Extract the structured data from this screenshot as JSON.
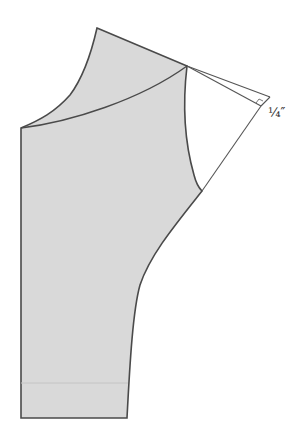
{
  "diagram": {
    "type": "sewing-pattern",
    "annotation_label": "¼″",
    "colors": {
      "fill": "#d9d9d9",
      "stroke": "#4a4a4a",
      "guide_stroke": "#555555",
      "background": "#ffffff"
    }
  }
}
